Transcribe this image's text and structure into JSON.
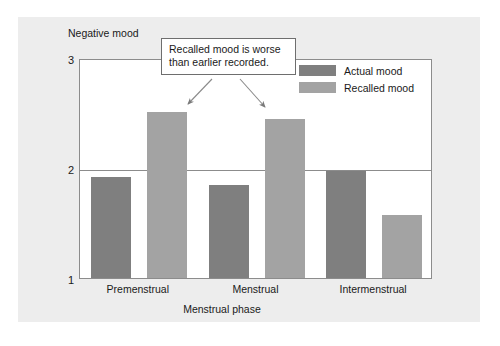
{
  "chart_data": {
    "type": "bar",
    "title": "",
    "xlabel": "Menstrual phase",
    "ylabel": "Negative mood",
    "categories": [
      "Premenstrual",
      "Menstrual",
      "Intermenstrual"
    ],
    "series": [
      {
        "name": "Actual mood",
        "color": "#7f7f7f",
        "values": [
          1.92,
          1.85,
          1.97
        ]
      },
      {
        "name": "Recalled mood",
        "color": "#a3a3a3",
        "values": [
          2.51,
          2.45,
          1.57
        ]
      }
    ],
    "ylim": [
      1,
      3
    ],
    "yticks": [
      "1",
      "2",
      "3"
    ],
    "ytick_values": [
      1,
      2,
      3
    ],
    "grid": true,
    "legend_position": "top-right"
  },
  "annotation": {
    "name": "callout-note",
    "lines": [
      "Recalled mood is worse",
      "than earlier recorded."
    ],
    "arrow_targets": [
      "Premenstrual recalled bar",
      "Menstrual recalled bar"
    ]
  },
  "colors": {
    "panel_background": "#ededed",
    "plot_background": "#ffffff",
    "axis_line": "#8c8c8c",
    "text": "#1a1a1a",
    "actual_mood": "#7f7f7f",
    "recalled_mood": "#a3a3a3"
  }
}
